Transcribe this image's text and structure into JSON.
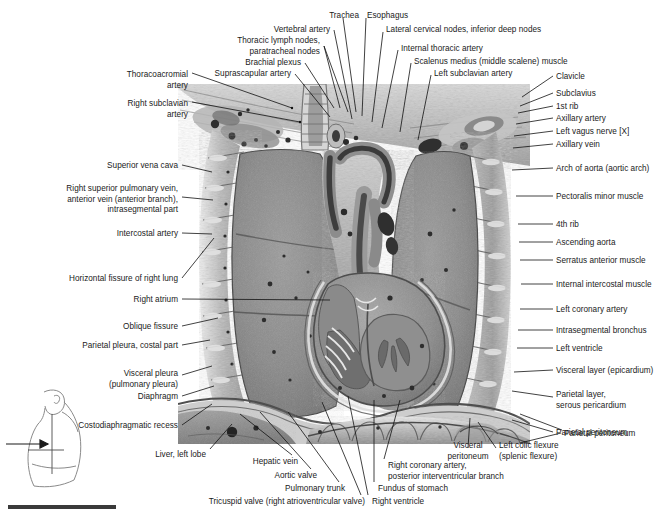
{
  "plate": {
    "title": "Frontal (coronal) section of the thorax and upper abdomen",
    "width": 672,
    "height": 519,
    "background": "#ffffff",
    "label_color": "#1a1a1a",
    "leader_color": "#111111"
  },
  "labels_top": [
    {
      "id": "thoracoacromial-artery",
      "lines": [
        "Thoracoacromial",
        "artery"
      ],
      "align": "right",
      "x": 188,
      "y": 70
    },
    {
      "id": "right-subclavian-artery",
      "lines": [
        "Right subclavian",
        "artery"
      ],
      "align": "right",
      "x": 188,
      "y": 99
    },
    {
      "id": "suprascapular-artery",
      "lines": [
        "Suprascapular artery"
      ],
      "align": "right",
      "x": 291,
      "y": 69
    },
    {
      "id": "brachial-plexus",
      "lines": [
        "Brachial plexus"
      ],
      "align": "right",
      "x": 301,
      "y": 58
    },
    {
      "id": "thoracic-lymph-nodes",
      "lines": [
        "Thoracic lymph nodes,",
        "paratracheal nodes"
      ],
      "align": "right",
      "x": 320,
      "y": 36
    },
    {
      "id": "vertebral-artery",
      "lines": [
        "Vertebral artery"
      ],
      "align": "right",
      "x": 330,
      "y": 25
    },
    {
      "id": "trachea",
      "lines": [
        "Trachea"
      ],
      "align": "right",
      "x": 359,
      "y": 11
    },
    {
      "id": "esophagus",
      "lines": [
        "Esophagus"
      ],
      "align": "left",
      "x": 367,
      "y": 11
    },
    {
      "id": "lateral-cervical-nodes",
      "lines": [
        "Lateral cervical nodes, inferior deep nodes"
      ],
      "align": "left",
      "x": 386,
      "y": 25
    },
    {
      "id": "internal-thoracic-artery",
      "lines": [
        "Internal thoracic artery"
      ],
      "align": "left",
      "x": 401,
      "y": 44
    },
    {
      "id": "scalenus-medius-muscle",
      "lines": [
        "Scalenus medius (middle scalene) muscle"
      ],
      "align": "left",
      "x": 414,
      "y": 57
    },
    {
      "id": "left-subclavian-artery",
      "lines": [
        "Left subclavian artery"
      ],
      "align": "left",
      "x": 434,
      "y": 69
    }
  ],
  "labels_right": [
    {
      "id": "clavicle",
      "lines": [
        "Clavicle"
      ],
      "x": 556,
      "y": 72
    },
    {
      "id": "subclavius",
      "lines": [
        "Subclavius"
      ],
      "x": 556,
      "y": 89
    },
    {
      "id": "first-rib",
      "lines": [
        "1st rib"
      ],
      "x": 556,
      "y": 102
    },
    {
      "id": "axillary-artery",
      "lines": [
        "Axillary artery"
      ],
      "x": 556,
      "y": 114
    },
    {
      "id": "left-vagus-nerve",
      "lines": [
        "Left vagus nerve [X]"
      ],
      "x": 556,
      "y": 127
    },
    {
      "id": "axillary-vein",
      "lines": [
        "Axillary vein"
      ],
      "x": 556,
      "y": 140
    },
    {
      "id": "arch-of-aorta",
      "lines": [
        "Arch of aorta (aortic arch)"
      ],
      "x": 556,
      "y": 164
    },
    {
      "id": "pectoralis-minor-muscle",
      "lines": [
        "Pectoralis minor muscle"
      ],
      "x": 556,
      "y": 192
    },
    {
      "id": "fourth-rib",
      "lines": [
        "4th rib"
      ],
      "x": 556,
      "y": 220
    },
    {
      "id": "ascending-aorta",
      "lines": [
        "Ascending aorta"
      ],
      "x": 556,
      "y": 238
    },
    {
      "id": "serratus-anterior-muscle",
      "lines": [
        "Serratus anterior muscle"
      ],
      "x": 556,
      "y": 256
    },
    {
      "id": "internal-intercostal-muscle",
      "lines": [
        "Internal intercostal muscle"
      ],
      "x": 556,
      "y": 280
    },
    {
      "id": "left-coronary-artery",
      "lines": [
        "Left coronary artery"
      ],
      "x": 556,
      "y": 305
    },
    {
      "id": "intrasegmental-bronchus",
      "lines": [
        "Intrasegmental bronchus"
      ],
      "x": 556,
      "y": 326
    },
    {
      "id": "left-ventricle",
      "lines": [
        "Left ventricle"
      ],
      "x": 556,
      "y": 344
    },
    {
      "id": "visceral-layer-epicardium",
      "lines": [
        "Visceral layer (epicardium)"
      ],
      "x": 556,
      "y": 366
    },
    {
      "id": "parietal-layer-serous-pericardium",
      "lines": [
        "Parietal layer,",
        "serous pericardium"
      ],
      "x": 556,
      "y": 390
    },
    {
      "id": "parietal-peritoneum",
      "lines": [
        "Parietal peritoneum"
      ],
      "x": 556,
      "y": 428
    }
  ],
  "labels_left": [
    {
      "id": "superior-vena-cava",
      "lines": [
        "Superior vena cava"
      ],
      "x": 178,
      "y": 161
    },
    {
      "id": "right-superior-pulmonary-vein",
      "lines": [
        "Right superior pulmonary vein,",
        "anterior vein (anterior branch),",
        "intrasegmental part"
      ],
      "x": 178,
      "y": 184
    },
    {
      "id": "intercostal-artery",
      "lines": [
        "Intercostal artery"
      ],
      "x": 178,
      "y": 229
    },
    {
      "id": "horizontal-fissure-of-right-lung",
      "lines": [
        "Horizontal fissure of right lung"
      ],
      "x": 178,
      "y": 274
    },
    {
      "id": "right-atrium",
      "lines": [
        "Right atrium"
      ],
      "x": 178,
      "y": 295
    },
    {
      "id": "oblique-fissure",
      "lines": [
        "Oblique fissure"
      ],
      "x": 178,
      "y": 322
    },
    {
      "id": "parietal-pleura-costal-part",
      "lines": [
        "Parietal pleura, costal part"
      ],
      "x": 178,
      "y": 341
    },
    {
      "id": "visceral-pleura",
      "lines": [
        "Visceral pleura",
        "(pulmonary pleura)"
      ],
      "x": 178,
      "y": 369
    },
    {
      "id": "diaphragm",
      "lines": [
        "Diaphragm"
      ],
      "x": 178,
      "y": 392
    },
    {
      "id": "costodiaphragmatic-recess",
      "lines": [
        "Costodiaphragmatic recess"
      ],
      "x": 178,
      "y": 421
    }
  ],
  "labels_bottom": [
    {
      "id": "liver-left-lobe",
      "lines": [
        "Liver, left lobe"
      ],
      "align": "right",
      "x": 206,
      "y": 450
    },
    {
      "id": "hepatic-vein",
      "lines": [
        "Hepatic vein"
      ],
      "align": "right",
      "x": 298,
      "y": 457
    },
    {
      "id": "aortic-valve",
      "lines": [
        "Aortic valve"
      ],
      "align": "right",
      "x": 317,
      "y": 471
    },
    {
      "id": "pulmonary-trunk",
      "lines": [
        "Pulmonary trunk"
      ],
      "align": "right",
      "x": 345,
      "y": 484
    },
    {
      "id": "tricuspid-valve",
      "lines": [
        "Tricuspid valve (right atrioventricular valve)"
      ],
      "align": "right",
      "x": 365,
      "y": 497
    },
    {
      "id": "right-ventricle",
      "lines": [
        "Right ventricle"
      ],
      "align": "left",
      "x": 372,
      "y": 497
    },
    {
      "id": "fundus-of-stomach",
      "lines": [
        "Fundus of stomach"
      ],
      "align": "left",
      "x": 378,
      "y": 484
    },
    {
      "id": "right-coronary-artery",
      "lines": [
        "Right coronary artery,",
        "posterior interventricular branch"
      ],
      "align": "left",
      "x": 388,
      "y": 461
    },
    {
      "id": "visceral-peritoneum",
      "lines": [
        "Visceral",
        "peritoneum"
      ],
      "align": "center",
      "x": 468,
      "y": 441
    },
    {
      "id": "left-colic-flexure",
      "lines": [
        "Left colic flexure",
        "(splenic flexure)"
      ],
      "align": "left",
      "x": 499,
      "y": 441
    },
    {
      "id": "parietal-peritoneum-bottom",
      "lines": [
        "Parietal peritoneum"
      ],
      "align": "left",
      "x": 564,
      "y": 429
    }
  ],
  "orientation_thumbnail": {
    "id": "orientation-figure",
    "description": "lateral body outline with sectional plane and arrow indicating viewing direction"
  },
  "scale_bar": {
    "id": "scale-bar",
    "color": "#3a3a3a"
  }
}
